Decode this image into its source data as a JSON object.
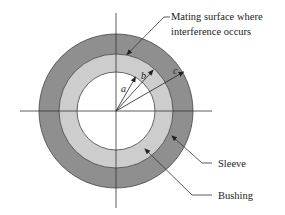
{
  "diagram": {
    "colors": {
      "sleeve": "#8f8f8f",
      "bushing": "#cdcdcd",
      "bore": "#ffffff",
      "lines": "#333333"
    },
    "geometry": {
      "center": [
        116,
        111
      ],
      "radius_a": 39,
      "radius_b": 57,
      "radius_c": 77
    },
    "labels": {
      "mating_surface_line1": "Mating surface where",
      "mating_surface_line2": "interference occurs",
      "sleeve": "Sleeve",
      "bushing": "Bushing",
      "radius_a": "a",
      "radius_b": "b",
      "radius_c": "c"
    }
  }
}
